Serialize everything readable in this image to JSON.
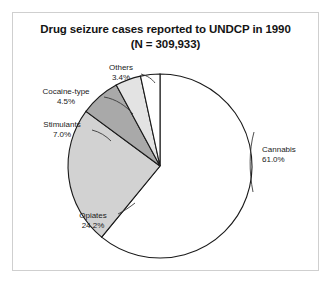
{
  "figure": {
    "title_line1": "Drug seizure cases reported to UNDCP in 1990",
    "title_line2": "(N = 309,933)"
  },
  "chart_data": {
    "type": "pie",
    "title": "Drug seizure cases reported to UNDCP in 1990 (N = 309,933)",
    "total_label": "(N = 309,933)",
    "total_value": 309933,
    "unit": "percent",
    "legend": "none",
    "labels_inline": true,
    "categories": [
      "Cannabis",
      "Opiates",
      "Stimulants",
      "Cocaine-type",
      "Others"
    ],
    "values": [
      61.0,
      24.2,
      7.0,
      4.5,
      3.4
    ],
    "value_labels": [
      "61.0%",
      "24.2%",
      "7.0%",
      "4.5%",
      "3.4%"
    ],
    "colors": [
      "#ffffff",
      "#d2d2d2",
      "#a9a9a9",
      "#e3e3e3",
      "#ffffff"
    ],
    "slices": [
      {
        "name": "Cannabis",
        "label": "Cannabis",
        "percent_label": "61.0%",
        "value": 61.0,
        "color": "#ffffff"
      },
      {
        "name": "Opiates",
        "label": "Opiates",
        "percent_label": "24.2%",
        "value": 24.2,
        "color": "#d2d2d2"
      },
      {
        "name": "Stimulants",
        "label": "Stimulants",
        "percent_label": "7.0%",
        "value": 7.0,
        "color": "#a9a9a9"
      },
      {
        "name": "Cocaine-type",
        "label": "Cocaine-type",
        "percent_label": "4.5%",
        "value": 4.5,
        "color": "#e3e3e3"
      },
      {
        "name": "Others",
        "label": "Others",
        "percent_label": "3.4%",
        "value": 3.4,
        "color": "#ffffff"
      }
    ],
    "geometry": {
      "cx": 160,
      "cy": 166,
      "r": 92,
      "start_angle_deg": 0,
      "direction": "clockwise"
    }
  },
  "labels": {
    "others": {
      "name": "Others",
      "pct": "3.4%"
    },
    "cocaine": {
      "name": "Cocaine-type",
      "pct": "4.5%"
    },
    "stimulants": {
      "name": "Stimulants",
      "pct": "7.0%"
    },
    "opiates": {
      "name": "Opiates",
      "pct": "24.2%"
    },
    "cannabis": {
      "name": "Cannabis",
      "pct": "61.0%"
    }
  }
}
